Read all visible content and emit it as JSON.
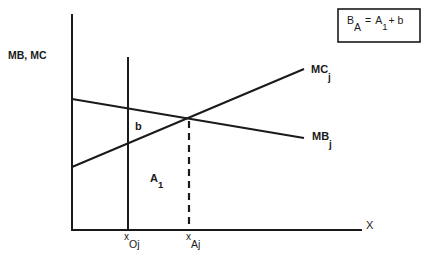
{
  "diagram": {
    "y_axis_label": "MB, MC",
    "x_axis_label": "X",
    "curves": {
      "mc": {
        "label": "MC",
        "subscript": "j"
      },
      "mb": {
        "label": "MB",
        "subscript": "j"
      }
    },
    "region_labels": {
      "b": "b",
      "a1": {
        "main": "A",
        "sub": "1"
      }
    },
    "x_ticks": {
      "x_oj": {
        "main": "x",
        "sub": "Oj"
      },
      "x_aj": {
        "main": "x",
        "sub": "Aj"
      }
    },
    "formula": {
      "lhs_main": "B",
      "lhs_sub": "A",
      "eq": "=",
      "rhs_main": "A",
      "rhs_sub": "1",
      "rhs_tail": "+ b"
    },
    "colors": {
      "line": "#1a1a1a",
      "background": "#ffffff"
    }
  }
}
